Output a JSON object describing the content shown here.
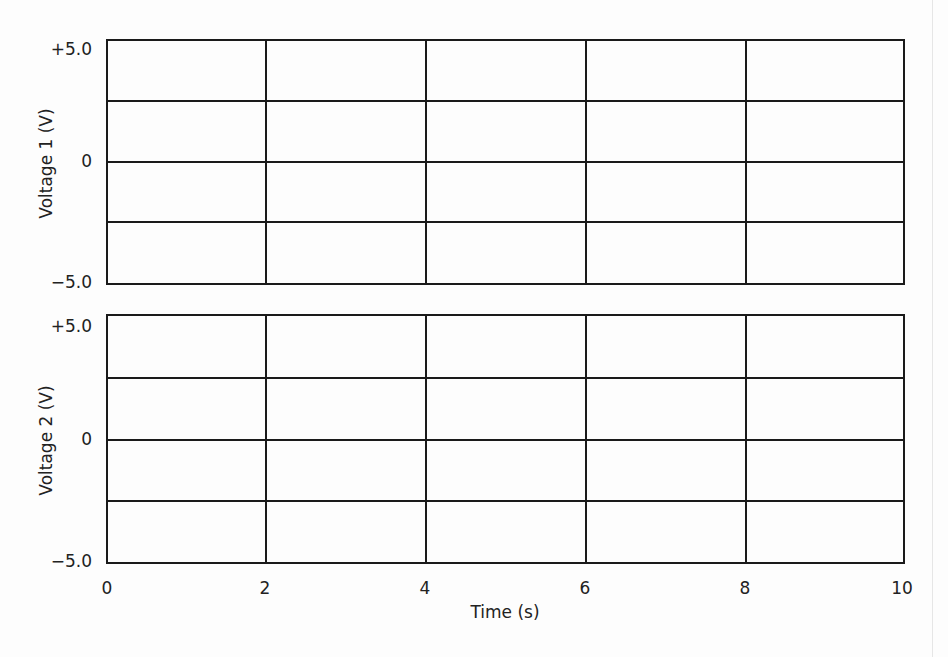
{
  "chart_data": [
    {
      "type": "line",
      "title": "",
      "xlabel": "Time (s)",
      "ylabel": "Voltage 1 (V)",
      "xlim": [
        0,
        10
      ],
      "ylim": [
        -5.0,
        5.0
      ],
      "x_ticks": [
        "0",
        "2",
        "4",
        "6",
        "8",
        "10"
      ],
      "y_ticks": [
        "+5.0",
        "0",
        "−5.0"
      ],
      "grid": true,
      "grid_x": [
        0,
        2,
        4,
        6,
        8,
        10
      ],
      "grid_y": [
        5.0,
        2.5,
        0,
        -2.5,
        -5.0
      ],
      "series": []
    },
    {
      "type": "line",
      "title": "",
      "xlabel": "Time (s)",
      "ylabel": "Voltage 2 (V)",
      "xlim": [
        0,
        10
      ],
      "ylim": [
        -5.0,
        5.0
      ],
      "x_ticks": [
        "0",
        "2",
        "4",
        "6",
        "8",
        "10"
      ],
      "y_ticks": [
        "+5.0",
        "0",
        "−5.0"
      ],
      "grid": true,
      "grid_x": [
        0,
        2,
        4,
        6,
        8,
        10
      ],
      "grid_y": [
        5.0,
        2.5,
        0,
        -2.5,
        -5.0
      ],
      "series": []
    }
  ],
  "top_chart": {
    "ylabel": "Voltage 1 (V)",
    "yticks": {
      "max": "+5.0",
      "mid": "0",
      "min": "−5.0"
    }
  },
  "bottom_chart": {
    "ylabel": "Voltage 2 (V)",
    "yticks": {
      "max": "+5.0",
      "mid": "0",
      "min": "−5.0"
    }
  },
  "x_axis": {
    "label": "Time (s)",
    "ticks": [
      "0",
      "2",
      "4",
      "6",
      "8",
      "10"
    ]
  }
}
